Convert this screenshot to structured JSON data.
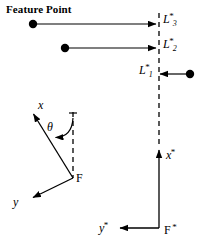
{
  "figure": {
    "name": "feature-point-coordinate-frame-diagram",
    "background_color": "#ffffff",
    "stroke_color": "#000000",
    "width": 199,
    "height": 251
  },
  "annotations": {
    "feature_point_title": "Feature Point",
    "theta": "θ"
  },
  "labels": {
    "L3": {
      "base": "L",
      "sup": "*",
      "sub": "3"
    },
    "L2": {
      "base": "L",
      "sup": "*",
      "sub": "2"
    },
    "L1": {
      "base": "L",
      "sup": "*",
      "sub": "1"
    },
    "x_axis": {
      "base": "x"
    },
    "y_axis": {
      "base": "y"
    },
    "origin_F": {
      "base": "F"
    },
    "x_star_axis": {
      "base": "x",
      "sup": "*"
    },
    "y_star_axis": {
      "base": "y",
      "sup": "*"
    },
    "origin_F_star": {
      "base": "F",
      "sup": "*"
    }
  },
  "geometry": {
    "dashed_vertical_line": {
      "x": 159,
      "y_top": 13,
      "y_bottom": 146
    },
    "feature_points": [
      {
        "name": "feature-point-3",
        "cx": 33,
        "cy": 24,
        "r": 4.2
      },
      {
        "name": "feature-point-2",
        "cx": 65,
        "cy": 48,
        "r": 4.2
      },
      {
        "name": "feature-point-1",
        "cx": 190,
        "cy": 74,
        "r": 4.2
      }
    ],
    "rays": [
      {
        "name": "ray-3",
        "x1": 37,
        "y1": 24,
        "x2": 156,
        "y2": 24,
        "direction": "right"
      },
      {
        "name": "ray-2",
        "x1": 69,
        "y1": 48,
        "x2": 156,
        "y2": 48,
        "direction": "right"
      },
      {
        "name": "ray-1",
        "x1": 186,
        "y1": 74,
        "x2": 160,
        "y2": 74,
        "direction": "left"
      }
    ],
    "frame_F": {
      "origin": {
        "x": 73,
        "y": 178
      },
      "x_tip": {
        "x": 31,
        "y": 110
      },
      "y_tip": {
        "x": 30,
        "y": 200
      },
      "dashed_ref": {
        "x": 73,
        "y_top": 112,
        "y_bottom": 178
      },
      "theta_arc": "angle between dashed vertical reference and x axis"
    },
    "frame_F_star": {
      "origin": {
        "x": 159,
        "y": 228
      },
      "x_tip": {
        "x": 159,
        "y": 147
      },
      "y_tip": {
        "x": 117,
        "y": 228
      }
    }
  },
  "label_positions": {
    "feature_point_title": {
      "left": 6,
      "top": 4
    },
    "L3": {
      "left": 163,
      "top": 10
    },
    "L2": {
      "left": 163,
      "top": 35
    },
    "L1": {
      "left": 139,
      "top": 61
    },
    "x_axis": {
      "left": 38,
      "top": 99
    },
    "theta": {
      "left": 47,
      "top": 121
    },
    "origin_F": {
      "left": 76,
      "top": 172
    },
    "y_axis": {
      "left": 13,
      "top": 196
    },
    "x_star_axis": {
      "left": 166,
      "top": 146
    },
    "y_star_axis": {
      "left": 99,
      "top": 219
    },
    "origin_F_star": {
      "left": 164,
      "top": 221
    }
  }
}
